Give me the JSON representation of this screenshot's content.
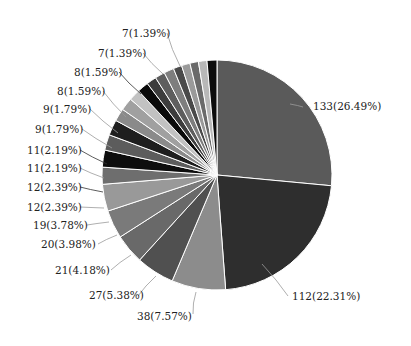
{
  "chart_data": {
    "type": "pie",
    "title": "",
    "start_angle_deg": 0,
    "direction": "clockwise",
    "total": 502,
    "slices": [
      {
        "value": 133,
        "label": "133(26.49%)",
        "percent": 26.49,
        "color": "#5a5a5a",
        "labeled": true
      },
      {
        "value": 112,
        "label": "112(22.31%)",
        "percent": 22.31,
        "color": "#2e2e2e",
        "labeled": true
      },
      {
        "value": 38,
        "label": "38(7.57%)",
        "percent": 7.57,
        "color": "#8c8c8c",
        "labeled": true
      },
      {
        "value": 27,
        "label": "27(5.38%)",
        "percent": 5.38,
        "color": "#505050",
        "labeled": true
      },
      {
        "value": 21,
        "label": "21(4.18%)",
        "percent": 4.18,
        "color": "#696969",
        "labeled": true
      },
      {
        "value": 20,
        "label": "20(3.98%)",
        "percent": 3.98,
        "color": "#7a7a7a",
        "labeled": true
      },
      {
        "value": 19,
        "label": "19(3.78%)",
        "percent": 3.78,
        "color": "#999999",
        "labeled": true
      },
      {
        "value": 12,
        "label": "12(2.39%)",
        "percent": 2.39,
        "color": "#6e6e6e",
        "labeled": true
      },
      {
        "value": 12,
        "label": "12(2.39%)",
        "percent": 2.39,
        "color": "#0d0d0d",
        "labeled": true
      },
      {
        "value": 11,
        "label": "11(2.19%)",
        "percent": 2.19,
        "color": "#5c5c5c",
        "labeled": true
      },
      {
        "value": 11,
        "label": "11(2.19%)",
        "percent": 2.19,
        "color": "#1e1e1e",
        "labeled": true
      },
      {
        "value": 9,
        "label": "9(1.79%)",
        "percent": 1.79,
        "color": "#8a8a8a",
        "labeled": true
      },
      {
        "value": 9,
        "label": "9(1.79%)",
        "percent": 1.79,
        "color": "#a0a0a0",
        "labeled": true
      },
      {
        "value": 8,
        "label": "8(1.59%)",
        "percent": 1.59,
        "color": "#c2c2c2",
        "labeled": true
      },
      {
        "value": 8,
        "label": "8(1.59%)",
        "percent": 1.59,
        "color": "#0a0a0a",
        "labeled": true
      },
      {
        "value": 7,
        "label": "7(1.39%)",
        "percent": 1.39,
        "color": "#3c3c3c",
        "labeled": true
      },
      {
        "value": 7,
        "label": "7(1.39%)",
        "percent": 1.39,
        "color": "#5e5e5e",
        "labeled": true
      },
      {
        "value": 7,
        "label": "",
        "percent": 1.39,
        "color": "#7e7e7e",
        "labeled": false
      },
      {
        "value": 6,
        "label": "",
        "percent": 1.2,
        "color": "#4a4a4a",
        "labeled": false
      },
      {
        "value": 6,
        "label": "",
        "percent": 1.2,
        "color": "#9a9a9a",
        "labeled": false
      },
      {
        "value": 6,
        "label": "",
        "percent": 1.2,
        "color": "#6a6a6a",
        "labeled": false
      },
      {
        "value": 6,
        "label": "",
        "percent": 1.2,
        "color": "#b8b8b8",
        "labeled": false
      },
      {
        "value": 7,
        "label": "",
        "percent": 1.39,
        "color": "#0c0c0c",
        "labeled": false
      }
    ],
    "label_positions": [
      {
        "x": 313,
        "y": 110,
        "anchor": "start",
        "lx": 290,
        "ly": 104,
        "px": 303,
        "py": 107
      },
      {
        "x": 292,
        "y": 300,
        "anchor": "start",
        "lx": 262,
        "ly": 264,
        "px": 288,
        "py": 296
      },
      {
        "x": 137,
        "y": 320,
        "anchor": "start",
        "lx": 196,
        "ly": 292,
        "px": 193,
        "py": 314
      },
      {
        "x": 89,
        "y": 299,
        "anchor": "start",
        "lx": 156,
        "ly": 276,
        "px": 138,
        "py": 296
      },
      {
        "x": 55,
        "y": 274,
        "anchor": "start",
        "lx": 131,
        "ly": 255,
        "px": 111,
        "py": 270
      },
      {
        "x": 41,
        "y": 248,
        "anchor": "start",
        "lx": 117,
        "ly": 235,
        "px": 98,
        "py": 244
      },
      {
        "x": 33,
        "y": 229,
        "anchor": "start",
        "lx": 109,
        "ly": 222,
        "px": 87,
        "py": 225
      },
      {
        "x": 27,
        "y": 211,
        "anchor": "start",
        "lx": 104,
        "ly": 208,
        "px": 80,
        "py": 207
      },
      {
        "x": 27,
        "y": 191,
        "anchor": "start",
        "lx": 103,
        "ly": 192,
        "px": 80,
        "py": 187
      },
      {
        "x": 27,
        "y": 172,
        "anchor": "start",
        "lx": 104,
        "ly": 178,
        "px": 80,
        "py": 168
      },
      {
        "x": 27,
        "y": 154,
        "anchor": "start",
        "lx": 107,
        "ly": 164,
        "px": 80,
        "py": 150
      },
      {
        "x": 35,
        "y": 133,
        "anchor": "start",
        "lx": 112,
        "ly": 148,
        "px": 82,
        "py": 129
      },
      {
        "x": 43,
        "y": 113,
        "anchor": "start",
        "lx": 118,
        "ly": 133,
        "px": 90,
        "py": 109
      },
      {
        "x": 57,
        "y": 95,
        "anchor": "start",
        "lx": 126,
        "ly": 117,
        "px": 103,
        "py": 91
      },
      {
        "x": 74,
        "y": 76,
        "anchor": "start",
        "lx": 141,
        "ly": 94,
        "px": 119,
        "py": 72
      },
      {
        "x": 98,
        "y": 57,
        "anchor": "start",
        "lx": 163,
        "ly": 74,
        "px": 143,
        "py": 53
      },
      {
        "x": 122,
        "y": 37,
        "anchor": "start",
        "lx": 180,
        "ly": 66,
        "px": 167,
        "py": 33
      }
    ],
    "center": {
      "cx": 217,
      "cy": 175
    },
    "radius": 115,
    "legend": "none"
  }
}
